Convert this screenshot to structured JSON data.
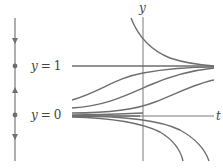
{
  "colors": {
    "curve": "#6e6e6e",
    "axis": "#7a7a7a",
    "text": "#444444",
    "background": "#ffffff"
  },
  "phase_line": {
    "equilibria": [
      {
        "label_var": "y",
        "label_eq": "=",
        "label_val": "1",
        "type": "stable"
      },
      {
        "label_var": "y",
        "label_eq": "=",
        "label_val": "0",
        "type": "unstable"
      }
    ],
    "arrows": [
      "down",
      "up",
      "down"
    ]
  },
  "axes": {
    "y_label": "y",
    "t_label": "t"
  },
  "solution_curves": {
    "description": "Solution curves of logistic-type ODE: curves above y=1 decay to 1, curves between 0 and 1 rise to 1, curves below 0 diverge downward",
    "count_above_one": 1,
    "count_between": 3,
    "count_below_zero": 2
  }
}
